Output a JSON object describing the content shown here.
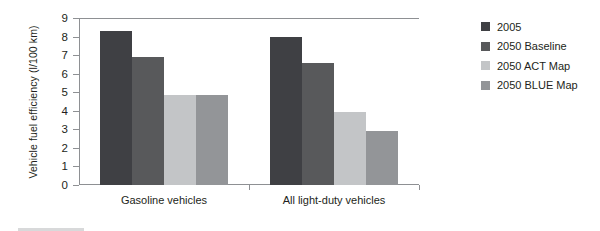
{
  "chart_data": {
    "type": "bar",
    "title": "",
    "xlabel": "",
    "ylabel": "Vehicle fuel efficiency (l/100 km)",
    "ylim": [
      0,
      9
    ],
    "ytick_labels": [
      "9",
      "8",
      "7",
      "6",
      "5",
      "4",
      "3",
      "2",
      "1",
      "0"
    ],
    "yticks": [
      9,
      8,
      7,
      6,
      5,
      4,
      3,
      2,
      1,
      0
    ],
    "grid": false,
    "legend_position": "right",
    "categories": [
      "Gasoline vehicles",
      "All light-duty vehicles"
    ],
    "series": [
      {
        "name": "2005",
        "color": "#3f4044",
        "values": [
          8.3,
          8.0
        ]
      },
      {
        "name": "2050 Baseline",
        "color": "#58595b",
        "values": [
          6.9,
          6.55
        ]
      },
      {
        "name": "2050 ACT Map",
        "color": "#c3c5c7",
        "values": [
          4.85,
          3.95
        ]
      },
      {
        "name": "2050 BLUE Map",
        "color": "#939598",
        "values": [
          4.85,
          2.9
        ]
      }
    ]
  },
  "axis": {
    "y_title": "Vehicle fuel efficiency (l/100 km)"
  },
  "legend": {
    "items": [
      {
        "label": "2005"
      },
      {
        "label": "2050 Baseline"
      },
      {
        "label": "2050 ACT Map"
      },
      {
        "label": "2050 BLUE Map"
      }
    ]
  }
}
